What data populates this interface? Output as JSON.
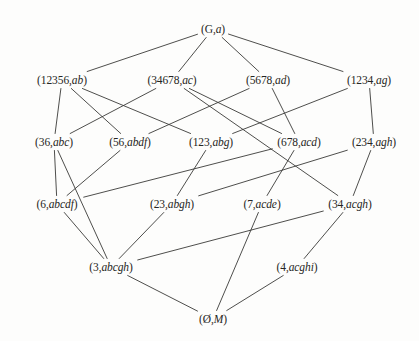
{
  "figure": {
    "kind": "hasse-diagram",
    "title": "",
    "background_color": "#fdfdfc",
    "line_color": "#3a3a38",
    "text_color": "#252523"
  },
  "chart_data": {
    "type": "diagram",
    "title": "",
    "nodes": [
      {
        "id": "n0",
        "extent": "G",
        "intent": "a",
        "label": "(G,a)",
        "x": 213,
        "y": 29,
        "level": 0
      },
      {
        "id": "n1",
        "extent": "12356",
        "intent": "ab",
        "label": "(12356,ab)",
        "x": 62,
        "y": 80,
        "level": 1
      },
      {
        "id": "n2",
        "extent": "34678",
        "intent": "ac",
        "label": "(34678,ac)",
        "x": 172,
        "y": 80,
        "level": 1
      },
      {
        "id": "n3",
        "extent": "5678",
        "intent": "ad",
        "label": "(5678,ad)",
        "x": 268,
        "y": 80,
        "level": 1
      },
      {
        "id": "n4",
        "extent": "1234",
        "intent": "ag",
        "label": "(1234,ag)",
        "x": 369,
        "y": 80,
        "level": 1
      },
      {
        "id": "n5",
        "extent": "36",
        "intent": "abc",
        "label": "(36,abc)",
        "x": 54,
        "y": 142,
        "level": 2
      },
      {
        "id": "n6",
        "extent": "56",
        "intent": "abdf",
        "label": "(56,abdf)",
        "x": 130,
        "y": 142,
        "level": 2
      },
      {
        "id": "n7",
        "extent": "123",
        "intent": "abg",
        "label": "(123,abg)",
        "x": 211,
        "y": 142,
        "level": 2
      },
      {
        "id": "n8",
        "extent": "678",
        "intent": "acd",
        "label": "(678,acd)",
        "x": 299,
        "y": 142,
        "level": 2
      },
      {
        "id": "n9",
        "extent": "234",
        "intent": "agh",
        "label": "(234,agh)",
        "x": 374,
        "y": 142,
        "level": 2
      },
      {
        "id": "n10",
        "extent": "6",
        "intent": "abcdf",
        "label": "(6,abcdf)",
        "x": 57,
        "y": 204,
        "level": 3
      },
      {
        "id": "n11",
        "extent": "23",
        "intent": "abgh",
        "label": "(23,abgh)",
        "x": 172,
        "y": 204,
        "level": 3
      },
      {
        "id": "n12",
        "extent": "7",
        "intent": "acde",
        "label": "(7,acde)",
        "x": 262,
        "y": 204,
        "level": 3
      },
      {
        "id": "n13",
        "extent": "34",
        "intent": "acgh",
        "label": "(34,acgh)",
        "x": 350,
        "y": 204,
        "level": 3
      },
      {
        "id": "n14",
        "extent": "3",
        "intent": "abcgh",
        "label": "(3,abcgh)",
        "x": 111,
        "y": 267,
        "level": 4
      },
      {
        "id": "n15",
        "extent": "4",
        "intent": "acghi",
        "label": "(4,acghi)",
        "x": 297,
        "y": 267,
        "level": 4
      },
      {
        "id": "n16",
        "extent": "Ø",
        "intent": "M",
        "label": "(Ø,M)",
        "x": 213,
        "y": 319,
        "level": 5
      }
    ],
    "edges": [
      {
        "from": "n0",
        "to": "n1"
      },
      {
        "from": "n0",
        "to": "n2"
      },
      {
        "from": "n0",
        "to": "n3"
      },
      {
        "from": "n0",
        "to": "n4"
      },
      {
        "from": "n1",
        "to": "n5"
      },
      {
        "from": "n1",
        "to": "n6"
      },
      {
        "from": "n1",
        "to": "n7"
      },
      {
        "from": "n2",
        "to": "n5"
      },
      {
        "from": "n2",
        "to": "n8"
      },
      {
        "from": "n2",
        "to": "n13"
      },
      {
        "from": "n3",
        "to": "n6"
      },
      {
        "from": "n3",
        "to": "n8"
      },
      {
        "from": "n4",
        "to": "n7"
      },
      {
        "from": "n4",
        "to": "n9"
      },
      {
        "from": "n5",
        "to": "n10"
      },
      {
        "from": "n5",
        "to": "n14"
      },
      {
        "from": "n6",
        "to": "n10"
      },
      {
        "from": "n7",
        "to": "n11"
      },
      {
        "from": "n8",
        "to": "n10"
      },
      {
        "from": "n8",
        "to": "n12"
      },
      {
        "from": "n9",
        "to": "n11"
      },
      {
        "from": "n9",
        "to": "n13"
      },
      {
        "from": "n10",
        "to": "n14"
      },
      {
        "from": "n11",
        "to": "n14"
      },
      {
        "from": "n12",
        "to": "n16"
      },
      {
        "from": "n13",
        "to": "n14"
      },
      {
        "from": "n13",
        "to": "n15"
      },
      {
        "from": "n14",
        "to": "n16"
      },
      {
        "from": "n15",
        "to": "n16"
      }
    ],
    "levels": 6,
    "node_count": 17,
    "edge_count": 29
  }
}
